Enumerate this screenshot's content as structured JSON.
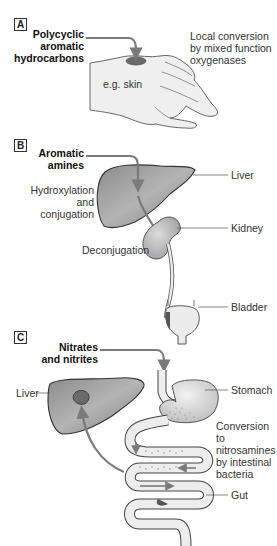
{
  "figure": {
    "panels": [
      {
        "id": "A",
        "letter": "A",
        "agent": "Polycyclic aromatic hydrocarbons",
        "agent_lines": [
          "Polycyclic",
          "aromatic",
          "hydrocarbons"
        ],
        "site_label": "e.g. skin",
        "mechanism_lines": [
          "Local conversion",
          "by mixed function",
          "oxygenases"
        ]
      },
      {
        "id": "B",
        "letter": "B",
        "agent_lines": [
          "Aromatic",
          "amines"
        ],
        "process_lines": [
          "Hydroxylation",
          "and conjugation"
        ],
        "deconjugation": "Deconjugation",
        "organs": {
          "liver": "Liver",
          "kidney": "Kidney",
          "bladder": "Bladder"
        }
      },
      {
        "id": "C",
        "letter": "C",
        "agent_lines": [
          "Nitrates",
          "and nitrites"
        ],
        "organs": {
          "liver": "Liver",
          "stomach": "Stomach",
          "gut": "Gut"
        },
        "mechanism_lines": [
          "Conversion to",
          "nitrosamines",
          "by intestinal",
          "bacteria"
        ]
      }
    ],
    "colors": {
      "organ_fill": "#9a9a9a",
      "organ_dark": "#6a6a6a",
      "tissue_light": "#e6e6e6",
      "arrow": "#7a7a7a",
      "outline": "#444444",
      "lesion": "#5a5a5a"
    }
  }
}
